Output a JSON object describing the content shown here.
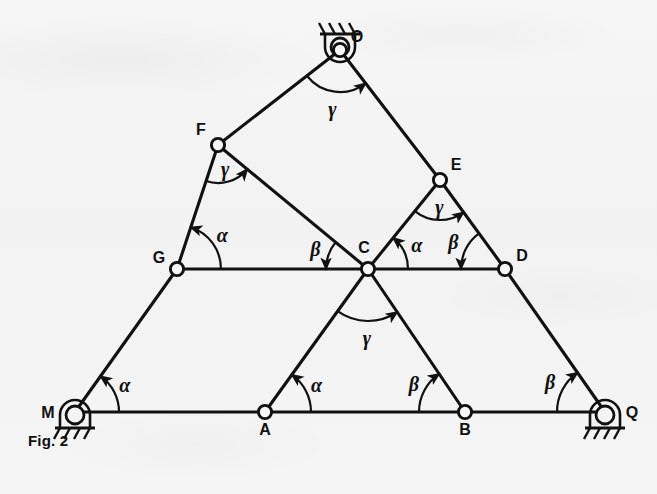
{
  "figure": {
    "caption": "Fig. 2",
    "background_color": "#f4f4f4",
    "ink_color": "#111111"
  },
  "diagram": {
    "type": "structural-truss-schematic",
    "nodes": [
      {
        "id": "O",
        "label": "O",
        "x": 340,
        "y": 50,
        "label_dx": 17,
        "label_dy": -8,
        "support": "pin-top",
        "joint_marker": "circle"
      },
      {
        "id": "F",
        "label": "F",
        "x": 218,
        "y": 145,
        "label_dx": -17,
        "label_dy": -10,
        "support": "none",
        "joint_marker": "circle"
      },
      {
        "id": "E",
        "label": "E",
        "x": 440,
        "y": 180,
        "label_dx": 16,
        "label_dy": -10,
        "support": "none",
        "joint_marker": "circle"
      },
      {
        "id": "G",
        "label": "G",
        "x": 177,
        "y": 269,
        "label_dx": -18,
        "label_dy": -6,
        "support": "none",
        "joint_marker": "circle"
      },
      {
        "id": "C",
        "label": "C",
        "x": 368,
        "y": 269,
        "label_dx": -4,
        "label_dy": -16,
        "support": "none",
        "joint_marker": "circle"
      },
      {
        "id": "D",
        "label": "D",
        "x": 505,
        "y": 269,
        "label_dx": 17,
        "label_dy": -8,
        "support": "none",
        "joint_marker": "circle"
      },
      {
        "id": "M",
        "label": "M",
        "x": 75,
        "y": 412,
        "label_dx": -27,
        "label_dy": 6,
        "support": "pin-bottom",
        "joint_marker": "none"
      },
      {
        "id": "A",
        "label": "A",
        "x": 265,
        "y": 412,
        "label_dx": 0,
        "label_dy": 23,
        "support": "none",
        "joint_marker": "circle"
      },
      {
        "id": "B",
        "label": "B",
        "x": 465,
        "y": 412,
        "label_dx": 0,
        "label_dy": 23,
        "support": "none",
        "joint_marker": "circle"
      },
      {
        "id": "Q",
        "label": "Q",
        "x": 605,
        "y": 412,
        "label_dx": 27,
        "label_dy": 6,
        "support": "pin-bottom",
        "joint_marker": "none"
      }
    ],
    "members": [
      {
        "from": "O",
        "to": "F"
      },
      {
        "from": "F",
        "to": "G"
      },
      {
        "from": "G",
        "to": "M"
      },
      {
        "from": "O",
        "to": "E"
      },
      {
        "from": "E",
        "to": "D"
      },
      {
        "from": "D",
        "to": "Q"
      },
      {
        "from": "F",
        "to": "C"
      },
      {
        "from": "E",
        "to": "C"
      },
      {
        "from": "G",
        "to": "C"
      },
      {
        "from": "C",
        "to": "D"
      },
      {
        "from": "C",
        "to": "A"
      },
      {
        "from": "C",
        "to": "B"
      },
      {
        "from": "M",
        "to": "A"
      },
      {
        "from": "A",
        "to": "B"
      },
      {
        "from": "B",
        "to": "Q"
      }
    ],
    "angles": [
      {
        "id": "angle-O",
        "symbol": "γ",
        "at": "O",
        "from": "F",
        "to": "E",
        "radius": 42,
        "label_r": 60
      },
      {
        "id": "angle-F",
        "symbol": "γ",
        "at": "F",
        "from": "G",
        "to": "C",
        "radius": 38,
        "label_r": 26
      },
      {
        "id": "angle-E",
        "symbol": "γ",
        "at": "E",
        "from": "C",
        "to": "D",
        "radius": 40,
        "label_r": 28
      },
      {
        "id": "angle-G",
        "symbol": "α",
        "at": "G",
        "from": "C",
        "to": "F",
        "radius": 44,
        "label_r": 56
      },
      {
        "id": "angle-C-left",
        "symbol": "β",
        "at": "C",
        "from": "F",
        "to": "G",
        "radius": 42,
        "label_r": 56
      },
      {
        "id": "angle-C-right",
        "symbol": "α",
        "at": "C",
        "from": "D",
        "to": "E",
        "radius": 40,
        "label_r": 54
      },
      {
        "id": "angle-C-down",
        "symbol": "γ",
        "at": "C",
        "from": "A",
        "to": "B",
        "radius": 52,
        "label_r": 70
      },
      {
        "id": "angle-D",
        "symbol": "β",
        "at": "D",
        "from": "E",
        "to": "C",
        "radius": 44,
        "label_r": 58
      },
      {
        "id": "angle-M",
        "symbol": "α",
        "at": "M",
        "from": "A",
        "to": "G",
        "radius": 44,
        "label_r": 56
      },
      {
        "id": "angle-A",
        "symbol": "α",
        "at": "A",
        "from": "B",
        "to": "C",
        "radius": 46,
        "label_r": 58
      },
      {
        "id": "angle-B",
        "symbol": "β",
        "at": "B",
        "from": "A",
        "to": "C",
        "radius": 46,
        "label_r": 58
      },
      {
        "id": "angle-Q",
        "symbol": "β",
        "at": "Q",
        "from": "B",
        "to": "D",
        "radius": 48,
        "label_r": 62
      }
    ],
    "supports": [
      {
        "id": "support-O",
        "node": "O",
        "kind": "pin",
        "orientation": "up",
        "hatch_count": 4
      },
      {
        "id": "support-M",
        "node": "M",
        "kind": "pin",
        "orientation": "down",
        "hatch_count": 4
      },
      {
        "id": "support-Q",
        "node": "Q",
        "kind": "pin",
        "orientation": "down",
        "hatch_count": 4
      }
    ],
    "angle_symbols_used": [
      "α",
      "β",
      "γ"
    ]
  }
}
